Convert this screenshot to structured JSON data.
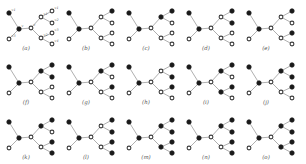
{
  "figure": {
    "layout": {
      "rows": 3,
      "cols": 5,
      "panel_width": 60,
      "panel_height": 54
    },
    "colors": {
      "filled": "#1a1a1a",
      "hollow_stroke": "#3a3a3a",
      "edge": "#9a9a9a"
    },
    "nodes": [
      {
        "id": "v1",
        "x": 9,
        "y": 13,
        "label": "v1"
      },
      {
        "id": "v2",
        "x": 19,
        "y": 29,
        "label": "v"
      },
      {
        "id": "v3",
        "x": 9,
        "y": 39,
        "label": "v3"
      },
      {
        "id": "v4",
        "x": 31,
        "y": 28,
        "label": "v"
      },
      {
        "id": "v5",
        "x": 41,
        "y": 17,
        "label": "v1"
      },
      {
        "id": "v6",
        "x": 41,
        "y": 38,
        "label": "v2"
      },
      {
        "id": "l1",
        "x": 52,
        "y": 11,
        "label": "v1"
      },
      {
        "id": "l2",
        "x": 52,
        "y": 23,
        "label": "v2"
      },
      {
        "id": "l3",
        "x": 52,
        "y": 33,
        "label": "v3"
      },
      {
        "id": "l4",
        "x": 52,
        "y": 44,
        "label": "v4"
      }
    ],
    "edges": [
      [
        "v1",
        "v2"
      ],
      [
        "v2",
        "v3"
      ],
      [
        "v2",
        "v4"
      ],
      [
        "v4",
        "v5"
      ],
      [
        "v4",
        "v6"
      ],
      [
        "v5",
        "l1"
      ],
      [
        "v5",
        "l2"
      ],
      [
        "v6",
        "l3"
      ],
      [
        "v6",
        "l4"
      ]
    ],
    "panels": [
      {
        "label": "(a)",
        "filled": [
          "v1",
          "v2"
        ],
        "show_vertex_labels": true
      },
      {
        "label": "(b)",
        "filled": [
          "v1",
          "v2",
          "l1"
        ]
      },
      {
        "label": "(c)",
        "filled": [
          "v1",
          "v2",
          "v5",
          "l1"
        ]
      },
      {
        "label": "(d)",
        "filled": [
          "v1",
          "v2",
          "l1",
          "l2"
        ]
      },
      {
        "label": "(e)",
        "filled": [
          "v1",
          "v2",
          "l1",
          "l3"
        ]
      },
      {
        "label": "(f)",
        "filled": [
          "v1",
          "v2",
          "v5",
          "l1",
          "l2"
        ]
      },
      {
        "label": "(g)",
        "filled": [
          "v1",
          "v2",
          "v5",
          "l1",
          "l3"
        ]
      },
      {
        "label": "(h)",
        "filled": [
          "v1",
          "v2",
          "l1",
          "l2",
          "l3"
        ]
      },
      {
        "label": "(i)",
        "filled": [
          "v1",
          "v2",
          "v5",
          "l1",
          "v6",
          "l3"
        ]
      },
      {
        "label": "(j)",
        "filled": [
          "v1",
          "v2",
          "v5",
          "l1",
          "l2",
          "l3"
        ]
      },
      {
        "label": "(k)",
        "filled": [
          "v1",
          "v2",
          "v5",
          "l1",
          "l3",
          "l4"
        ]
      },
      {
        "label": "(l)",
        "filled": [
          "v1",
          "v2",
          "l1",
          "l2",
          "l3",
          "l4"
        ]
      },
      {
        "label": "(m)",
        "filled": [
          "v1",
          "v2",
          "v5",
          "l1",
          "l2",
          "v6",
          "l3",
          "l4"
        ]
      },
      {
        "label": "(n)",
        "filled": [
          "v1",
          "v2",
          "v5",
          "l1",
          "l2",
          "l3",
          "l4"
        ]
      },
      {
        "label": "(o)",
        "filled": [
          "v1",
          "v2",
          "v5",
          "l1",
          "l2",
          "v6",
          "l3",
          "l4"
        ]
      }
    ]
  }
}
